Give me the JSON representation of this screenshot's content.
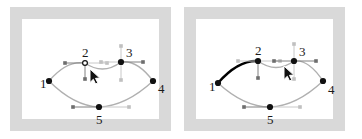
{
  "app": {
    "title": "Graph node editor — two states",
    "panel_count": 2,
    "background_color": "#ffffff",
    "mat_color": "#d9d9d9",
    "canvas_color": "#ffffff"
  },
  "colors": {
    "node_fill": "#111111",
    "node_open_stroke": "#111111",
    "edge_normal": "#b0b0b0",
    "edge_selected": "#000000",
    "handle_line": "#808080",
    "handle_line_light": "#c8c8c8",
    "handle_dot": "#6e6e6e",
    "handle_dot_light": "#c0c0c0",
    "label_color": "#1a1a1a",
    "cursor_fill": "#111111",
    "cursor_stroke": "#ffffff"
  },
  "panels": [
    {
      "id": "panel-left",
      "state_label": "before",
      "selected_edge": null,
      "cursor": {
        "x": 68,
        "y": 50,
        "visible": true
      },
      "nodes": [
        {
          "id": 1,
          "label": "1",
          "x": 27,
          "y": 62,
          "style": "filled",
          "label_dx": -9,
          "label_dy": -4
        },
        {
          "id": 2,
          "label": "2",
          "x": 63,
          "y": 44,
          "style": "open",
          "label_dx": -3,
          "label_dy": -17
        },
        {
          "id": 3,
          "label": "3",
          "x": 99,
          "y": 43,
          "style": "filled",
          "label_dx": 5,
          "label_dy": -16
        },
        {
          "id": 4,
          "label": "4",
          "x": 131,
          "y": 62,
          "style": "filled",
          "label_dx": 5,
          "label_dy": 1
        },
        {
          "id": 5,
          "label": "5",
          "x": 77,
          "y": 88,
          "style": "filled",
          "label_dx": -3,
          "label_dy": 6
        }
      ],
      "edges": [
        {
          "from": 1,
          "to": 2,
          "style": "normal",
          "curve": "up"
        },
        {
          "from": 2,
          "to": 3,
          "style": "normal",
          "curve": "dip"
        },
        {
          "from": 3,
          "to": 4,
          "style": "normal",
          "curve": "up"
        },
        {
          "from": 1,
          "to": 5,
          "style": "normal",
          "curve": "down"
        },
        {
          "from": 5,
          "to": 4,
          "style": "normal",
          "curve": "down"
        }
      ],
      "handles": [
        {
          "node": 2,
          "dir": "left",
          "len": 20,
          "tone": "mid"
        },
        {
          "node": 2,
          "dir": "right",
          "len": 22,
          "tone": "light"
        },
        {
          "node": 2,
          "dir": "down",
          "len": 16,
          "tone": "mid"
        },
        {
          "node": 3,
          "dir": "left",
          "len": 20,
          "tone": "light"
        },
        {
          "node": 3,
          "dir": "right",
          "len": 22,
          "tone": "mid"
        },
        {
          "node": 3,
          "dir": "up",
          "len": 16,
          "tone": "light"
        },
        {
          "node": 3,
          "dir": "down",
          "len": 18,
          "tone": "light"
        },
        {
          "node": 5,
          "dir": "left",
          "len": 26,
          "tone": "mid"
        },
        {
          "node": 5,
          "dir": "right",
          "len": 30,
          "tone": "light"
        }
      ]
    },
    {
      "id": "panel-right",
      "state_label": "after",
      "selected_edge": {
        "from": 1,
        "to": 2
      },
      "cursor": {
        "x": 88,
        "y": 47,
        "visible": true
      },
      "nodes": [
        {
          "id": 1,
          "label": "1",
          "x": 22,
          "y": 64,
          "style": "filled",
          "label_dx": -9,
          "label_dy": -3
        },
        {
          "id": 2,
          "label": "2",
          "x": 62,
          "y": 42,
          "style": "filled",
          "label_dx": -3,
          "label_dy": -17
        },
        {
          "id": 3,
          "label": "3",
          "x": 98,
          "y": 42,
          "style": "filled",
          "label_dx": 5,
          "label_dy": -16
        },
        {
          "id": 4,
          "label": "4",
          "x": 127,
          "y": 62,
          "style": "filled",
          "label_dx": 5,
          "label_dy": 2
        },
        {
          "id": 5,
          "label": "5",
          "x": 74,
          "y": 88,
          "style": "filled",
          "label_dx": -3,
          "label_dy": 6
        }
      ],
      "edges": [
        {
          "from": 1,
          "to": 2,
          "style": "selected",
          "curve": "up"
        },
        {
          "from": 2,
          "to": 3,
          "style": "normal",
          "curve": "dip"
        },
        {
          "from": 3,
          "to": 4,
          "style": "normal",
          "curve": "up"
        },
        {
          "from": 1,
          "to": 5,
          "style": "normal",
          "curve": "down"
        },
        {
          "from": 5,
          "to": 4,
          "style": "normal",
          "curve": "down"
        }
      ],
      "handles": [
        {
          "node": 2,
          "dir": "left",
          "len": 20,
          "tone": "light"
        },
        {
          "node": 2,
          "dir": "right",
          "len": 22,
          "tone": "light"
        },
        {
          "node": 2,
          "dir": "down",
          "len": 17,
          "tone": "mid"
        },
        {
          "node": 3,
          "dir": "left",
          "len": 20,
          "tone": "mid"
        },
        {
          "node": 3,
          "dir": "right",
          "len": 22,
          "tone": "mid"
        },
        {
          "node": 3,
          "dir": "up",
          "len": 17,
          "tone": "light"
        },
        {
          "node": 3,
          "dir": "down",
          "len": 18,
          "tone": "light"
        },
        {
          "node": 5,
          "dir": "left",
          "len": 26,
          "tone": "mid"
        },
        {
          "node": 5,
          "dir": "right",
          "len": 30,
          "tone": "light"
        }
      ]
    }
  ]
}
